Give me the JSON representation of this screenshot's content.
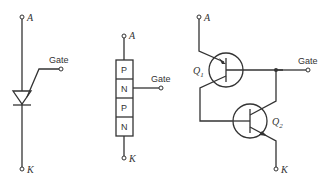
{
  "diagram": {
    "panels": [
      {
        "name": "scr-symbol",
        "labels": {
          "anode": "A",
          "gate": "Gate",
          "cathode": "K"
        }
      },
      {
        "name": "pnpn-layers",
        "labels": {
          "anode": "A",
          "gate": "Gate",
          "cathode": "K"
        },
        "layers": [
          "P",
          "N",
          "P",
          "N"
        ]
      },
      {
        "name": "two-transistor-model",
        "labels": {
          "anode": "A",
          "gate": "Gate",
          "cathode": "K",
          "q1": "Q",
          "q1_sub": "1",
          "q2": "Q",
          "q2_sub": "2"
        }
      }
    ]
  }
}
